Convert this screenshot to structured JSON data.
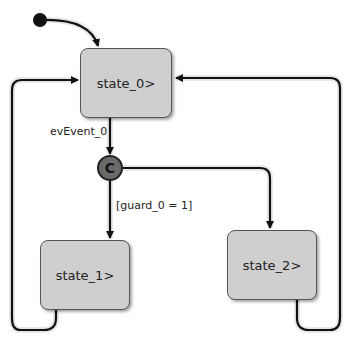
{
  "diagram": {
    "type": "statechart",
    "states": [
      {
        "id": "state_0",
        "label": "state_0>"
      },
      {
        "id": "state_1",
        "label": "state_1>"
      },
      {
        "id": "state_2",
        "label": "state_2>"
      }
    ],
    "junction": {
      "label": "C"
    },
    "transitions": [
      {
        "from": "initial",
        "to": "state_0",
        "label": ""
      },
      {
        "from": "state_0",
        "to": "junction",
        "label": "evEvent_0"
      },
      {
        "from": "junction",
        "to": "state_1",
        "label": "[guard_0 = 1]"
      },
      {
        "from": "junction",
        "to": "state_2",
        "label": ""
      },
      {
        "from": "state_1",
        "to": "state_0",
        "label": ""
      },
      {
        "from": "state_2",
        "to": "state_0",
        "label": ""
      }
    ]
  }
}
